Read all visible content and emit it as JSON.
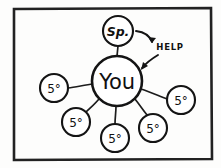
{
  "diagram": {
    "style": "hand-drawn sketch, black ink on white",
    "frame": {
      "name": "outer-frame",
      "x": 13,
      "y": 8,
      "width": 199,
      "height": 152,
      "color": "#222222"
    },
    "hub": {
      "label": "You",
      "cx": 117,
      "cy": 81,
      "r": 25,
      "color": "#141414"
    },
    "top_node": {
      "label": "Sp.",
      "cx": 118,
      "cy": 31,
      "r": 15,
      "color": "#141414"
    },
    "annotation": {
      "label": "HELP",
      "x": 160,
      "y": 48,
      "color": "#141414"
    },
    "satellites": [
      {
        "label": "5°",
        "cx": 54,
        "cy": 88,
        "r": 14
      },
      {
        "label": "5°",
        "cx": 76,
        "cy": 122,
        "r": 14
      },
      {
        "label": "5°",
        "cx": 115,
        "cy": 138,
        "r": 14
      },
      {
        "label": "5°",
        "cx": 153,
        "cy": 128,
        "r": 14
      },
      {
        "label": "5°",
        "cx": 181,
        "cy": 100,
        "r": 14
      }
    ],
    "connectors": [
      {
        "name": "spoke-to-sp",
        "x1": 117,
        "y1": 56,
        "x2": 118,
        "y2": 46
      },
      {
        "name": "spoke-to-satellite-left",
        "x1": 93,
        "y1": 84,
        "x2": 68,
        "y2": 88
      },
      {
        "name": "spoke-to-satellite-lower-left",
        "x1": 99,
        "y1": 99,
        "x2": 85,
        "y2": 113
      },
      {
        "name": "spoke-to-satellite-bottom",
        "x1": 116,
        "y1": 106,
        "x2": 115,
        "y2": 124
      },
      {
        "name": "spoke-to-satellite-lower-right",
        "x1": 135,
        "y1": 99,
        "x2": 147,
        "y2": 115
      },
      {
        "name": "spoke-to-satellite-right",
        "x1": 141,
        "y1": 89,
        "x2": 167,
        "y2": 99
      }
    ]
  }
}
